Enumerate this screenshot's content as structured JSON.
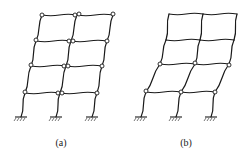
{
  "figure": {
    "colors": {
      "line": "#1a1a1a",
      "hinge_fill": "#ffffff",
      "background": "#ffffff"
    },
    "panels": [
      {
        "id": "a",
        "label": "(a)",
        "mechanism": "beam-hinge mechanism (hinges at beam ends on all floors)",
        "floors": [
          {
            "y": 15,
            "x": [
              42,
              77,
              113
            ]
          },
          {
            "y": 41,
            "x": [
              36,
              71,
              107
            ]
          },
          {
            "y": 66,
            "x": [
              31,
              66,
              102
            ]
          },
          {
            "y": 93,
            "x": [
              25,
              60,
              97
            ]
          }
        ],
        "bases": [
          21,
          56,
          92
        ],
        "base_y": 117,
        "hinges": [
          [
            42,
            15
          ],
          [
            75,
            15
          ],
          [
            79,
            14
          ],
          [
            113,
            14
          ],
          [
            36,
            40
          ],
          [
            69,
            41
          ],
          [
            73,
            41
          ],
          [
            107,
            41
          ],
          [
            31,
            65
          ],
          [
            64,
            66
          ],
          [
            68,
            66
          ],
          [
            102,
            66
          ],
          [
            25,
            92
          ],
          [
            58,
            93
          ],
          [
            62,
            93
          ],
          [
            97,
            93
          ]
        ],
        "label_pos": [
          61,
          146
        ]
      },
      {
        "id": "b",
        "label": "(b)",
        "mechanism": "story (column-hinge) mechanism concentrated in lower stories",
        "floors": [
          {
            "y": 14,
            "x": [
              169,
              203,
              237
            ]
          },
          {
            "y": 40,
            "x": [
              166,
              200,
              234
            ]
          },
          {
            "y": 64,
            "x": [
              160,
              195,
              229
            ]
          },
          {
            "y": 92,
            "x": [
              146,
              181,
              215
            ]
          }
        ],
        "bases": [
          141,
          176,
          211
        ],
        "base_y": 117,
        "hinges": [
          [
            160,
            64
          ],
          [
            195,
            63
          ],
          [
            229,
            65
          ],
          [
            146,
            91
          ],
          [
            181,
            92
          ],
          [
            215,
            92
          ]
        ],
        "label_pos": [
          186,
          146
        ]
      }
    ]
  }
}
